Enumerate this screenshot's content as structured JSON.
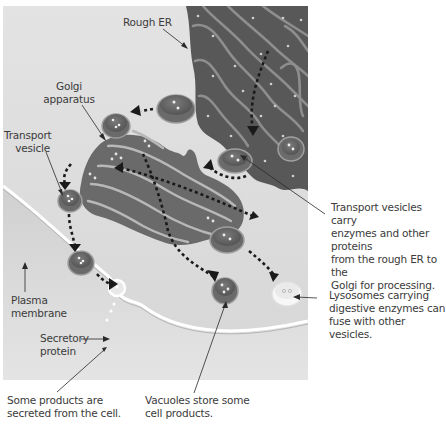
{
  "labels": {
    "rough_er": "Rough ER",
    "golgi_line1": "Golgi",
    "golgi_line2": "apparatus",
    "transport_line1": "Transport",
    "transport_line2": "vesicle",
    "plasma_line1": "Plasma",
    "plasma_line2": "membrane",
    "secretory_line1": "Secretory",
    "secretory_line2": "protein"
  },
  "captions": {
    "transport_vesicles": [
      "Transport vesicles carry",
      "enzymes and other proteins",
      "from the rough ER to the",
      "Golgi for processing."
    ],
    "lysosomes": [
      "Lysosomes carrying",
      "digestive enzymes can",
      "fuse with other vesicles."
    ],
    "secreted": [
      "Some products are",
      "secreted from the cell."
    ],
    "vacuoles": [
      "Vacuoles store some",
      "cell products."
    ]
  },
  "colors": {
    "cytoplasm": "#dcdcdc",
    "er": "#5c5c5c",
    "er_lumen": "#8a8a8a",
    "golgi": "#6e6e6e",
    "vesicle": "#737373",
    "lysosome": "#f2f2f2",
    "arrow": "#1a1a1a"
  }
}
